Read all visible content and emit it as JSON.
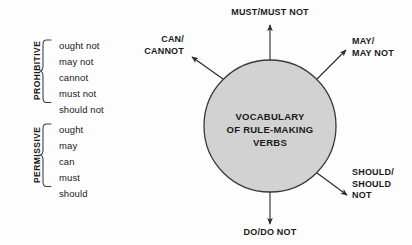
{
  "diagram": {
    "core": {
      "lines": [
        "VOCABULARY",
        "OF RULE-MAKING",
        "VERBS"
      ],
      "fill_color": "#d2d2d2",
      "stroke_color": "#3a3a3a"
    },
    "groups": [
      {
        "name": "prohibitive",
        "label": "PROHIBITIVE",
        "items": [
          "ought not",
          "may not",
          "cannot",
          "must not",
          "should not"
        ]
      },
      {
        "name": "permissive",
        "label": "PERMISSIVE",
        "items": [
          "ought",
          "may",
          "can",
          "must",
          "should"
        ]
      }
    ],
    "spokes": [
      {
        "name": "must",
        "lines": [
          "MUST/MUST NOT"
        ],
        "direction": "up"
      },
      {
        "name": "may",
        "lines": [
          "MAY/",
          "MAY NOT"
        ],
        "direction": "up-right"
      },
      {
        "name": "should",
        "lines": [
          "SHOULD/",
          "SHOULD",
          "NOT"
        ],
        "direction": "down-right"
      },
      {
        "name": "do",
        "lines": [
          "DO/DO NOT"
        ],
        "direction": "down"
      },
      {
        "name": "can",
        "lines": [
          "CAN/",
          "CANNOT"
        ],
        "direction": "up-left"
      }
    ]
  }
}
